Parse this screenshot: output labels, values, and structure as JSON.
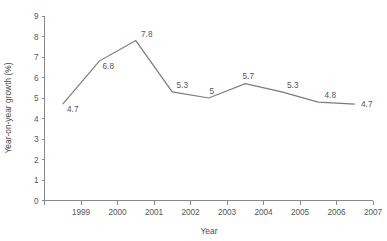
{
  "chart_data": {
    "type": "line",
    "title": "",
    "xlabel": "Year",
    "ylabel": "Year-on-year growth (%)",
    "categories": [
      "1999",
      "2000",
      "2001",
      "2002",
      "2003",
      "2004",
      "2005",
      "2006",
      "2007"
    ],
    "x_tick_labels": [
      "1999",
      "2000",
      "2001",
      "2002",
      "2003",
      "2004",
      "2005",
      "2006",
      "2007"
    ],
    "y_tick_labels": [
      "0",
      "1",
      "2",
      "3",
      "4",
      "5",
      "6",
      "7",
      "8",
      "9"
    ],
    "values": [
      4.7,
      6.8,
      7.8,
      5.3,
      5,
      5.7,
      5.3,
      4.8,
      4.7
    ],
    "point_labels": [
      "4.7",
      "6.8",
      "7.8",
      "5.3",
      "5",
      "5.7",
      "5.3",
      "4.8",
      "4.7"
    ],
    "label_offsets": [
      {
        "dx": 10,
        "dy": 8
      },
      {
        "dx": 9,
        "dy": 8
      },
      {
        "dx": 11,
        "dy": -4
      },
      {
        "dx": 10,
        "dy": -4
      },
      {
        "dx": 3,
        "dy": -4
      },
      {
        "dx": 3,
        "dy": -5
      },
      {
        "dx": 11,
        "dy": -4
      },
      {
        "dx": 12,
        "dy": -4
      },
      {
        "dx": 12,
        "dy": 3
      }
    ],
    "ylim": [
      0,
      9
    ],
    "y_step": 1,
    "xlim": [
      0,
      9
    ],
    "grid": false,
    "legend": false,
    "legend_position": "none",
    "colors": {
      "line": "#7b7b7b",
      "axis": "#8a8a8a",
      "text": "#555555",
      "background": "#ffffff"
    }
  }
}
